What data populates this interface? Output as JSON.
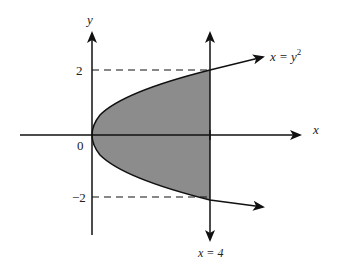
{
  "diagram": {
    "axes": {
      "x_label": "x",
      "y_label": "y",
      "origin_label": "0"
    },
    "ticks": {
      "y_pos": "2",
      "y_neg": "−2"
    },
    "curve": {
      "label_lhs": "x = y",
      "label_exp": "2",
      "equation": "x = y^2"
    },
    "vertical_line": {
      "label": "x = 4",
      "x_value": 4
    },
    "region": {
      "fill_color": "#8c8c8c",
      "description": "shaded region between parabola x=y^2 and line x=4, y from -2 to 2"
    },
    "colors": {
      "line": "#111111",
      "background": "#ffffff"
    }
  }
}
